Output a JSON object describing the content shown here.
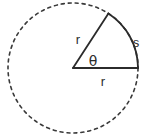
{
  "figure": {
    "kind": "circle-sector-diagram",
    "background_color": "#ffffff",
    "stroke_color": "#2b2b2b",
    "labels": {
      "radius_upper": "r",
      "radius_lower": "r",
      "arc": "s",
      "angle": "θ"
    },
    "geometry": {
      "center_x": 73,
      "center_y": 68,
      "radius": 65,
      "sector_start_angle_deg": 0,
      "sector_end_angle_deg": 57,
      "circle_style": "dashed",
      "sector_style": "solid"
    },
    "label_positions": {
      "radius_upper": {
        "x": 78,
        "y": 44
      },
      "radius_lower": {
        "x": 103,
        "y": 86
      },
      "arc": {
        "x": 136,
        "y": 47
      },
      "angle": {
        "x": 86,
        "y": 66
      }
    }
  }
}
